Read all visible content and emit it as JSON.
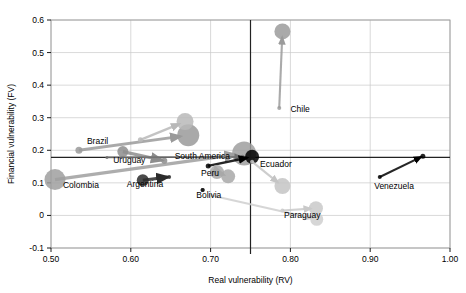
{
  "chart_data": {
    "type": "scatter",
    "title": "",
    "xlabel": "Real vulnerability (RV)",
    "ylabel": "Financial vulnerability (FV)",
    "xlim": [
      0.5,
      1.0
    ],
    "ylim": [
      -0.1,
      0.6
    ],
    "xticks": [
      "0.50",
      "0.60",
      "0.70",
      "0.80",
      "0.90",
      "1.00"
    ],
    "xtick_values": [
      0.5,
      0.6,
      0.7,
      0.8,
      0.9,
      1.0
    ],
    "yticks": [
      "-0.1",
      "0",
      "0.1",
      "0.2",
      "0.3",
      "0.4",
      "0.5",
      "0.6"
    ],
    "ytick_values": [
      -0.1,
      0,
      0.1,
      0.2,
      0.3,
      0.4,
      0.5,
      0.6
    ],
    "grid": true,
    "legend": "none",
    "reference_lines": [
      {
        "name": "vertical-reference-line",
        "orientation": "vertical",
        "value": 0.75
      },
      {
        "name": "horizontal-reference-line",
        "orientation": "horizontal",
        "value": 0.178
      }
    ],
    "annotations": [
      {
        "label": "Brazil",
        "x": 0.545,
        "y": 0.218
      },
      {
        "label": "Uruguay",
        "x": 0.578,
        "y": 0.162
      },
      {
        "label": "South America",
        "x": 0.655,
        "y": 0.172
      },
      {
        "label": "Colombia",
        "x": 0.515,
        "y": 0.083
      },
      {
        "label": "Argentina",
        "x": 0.595,
        "y": 0.088
      },
      {
        "label": "Peru",
        "x": 0.688,
        "y": 0.122
      },
      {
        "label": "Bolivia",
        "x": 0.682,
        "y": 0.055
      },
      {
        "label": "Ecuador",
        "x": 0.762,
        "y": 0.148
      },
      {
        "label": "Chile",
        "x": 0.8,
        "y": 0.318
      },
      {
        "label": "Paraguay",
        "x": 0.792,
        "y": -0.008
      },
      {
        "label": "Venezuela",
        "x": 0.905,
        "y": 0.082
      }
    ],
    "series": [
      {
        "name": "Brazil",
        "color": "#9a9a9a",
        "start": {
          "x": 0.535,
          "y": 0.2,
          "size": 7
        },
        "end": {
          "x": 0.672,
          "y": 0.246,
          "size": 22
        }
      },
      {
        "name": "Brazil-secondary",
        "color": "#b8b8b8",
        "start": {
          "x": 0.612,
          "y": 0.232,
          "size": 5
        },
        "end": {
          "x": 0.668,
          "y": 0.288,
          "size": 17
        }
      },
      {
        "name": "Colombia",
        "color": "#9f9f9f",
        "start": {
          "x": 0.505,
          "y": 0.11,
          "size": 21
        },
        "end": {
          "x": 0.742,
          "y": 0.19,
          "size": 24
        }
      },
      {
        "name": "Uruguay",
        "color": "#8d8d8d",
        "start": {
          "x": 0.59,
          "y": 0.196,
          "size": 11
        },
        "end": {
          "x": 0.642,
          "y": 0.168,
          "size": 6
        }
      },
      {
        "name": "South America",
        "color": "#707070",
        "start": {
          "x": 0.57,
          "y": 0.178,
          "size": 3
        },
        "end": {
          "x": 0.74,
          "y": 0.18,
          "size": 4
        }
      },
      {
        "name": "Argentina",
        "color": "#2b2b2b",
        "start": {
          "x": 0.615,
          "y": 0.108,
          "size": 12
        },
        "end": {
          "x": 0.648,
          "y": 0.118,
          "size": 4
        }
      },
      {
        "name": "Peru",
        "color": "#000000",
        "start": {
          "x": 0.697,
          "y": 0.152,
          "size": 5
        },
        "end": {
          "x": 0.752,
          "y": 0.18,
          "size": 14
        }
      },
      {
        "name": "Bolivia",
        "color": "#1a1a1a",
        "start": {
          "x": 0.69,
          "y": 0.078,
          "size": 4
        },
        "end": {
          "x": 0.69,
          "y": 0.078,
          "size": 4
        }
      },
      {
        "name": "Ecuador-cluster",
        "color": "#a8a8a8",
        "start": {
          "x": 0.708,
          "y": 0.133,
          "size": 14
        },
        "end": {
          "x": 0.722,
          "y": 0.12,
          "size": 14
        }
      },
      {
        "name": "Chile",
        "color": "#9b9b9b",
        "start": {
          "x": 0.786,
          "y": 0.33,
          "size": 4
        },
        "end": {
          "x": 0.79,
          "y": 0.565,
          "size": 16
        }
      },
      {
        "name": "Paraguay",
        "color": "#c9c9c9",
        "start": {
          "x": 0.79,
          "y": 0.015,
          "size": 4
        },
        "end": {
          "x": 0.832,
          "y": 0.022,
          "size": 14
        }
      },
      {
        "name": "Paraguay-secondary",
        "color": "#cfcfcf",
        "start": {
          "x": 0.7,
          "y": 0.062,
          "size": 4
        },
        "end": {
          "x": 0.833,
          "y": -0.012,
          "size": 13
        }
      },
      {
        "name": "Ecuador-down",
        "color": "#c4c4c4",
        "start": {
          "x": 0.752,
          "y": 0.165,
          "size": 4
        },
        "end": {
          "x": 0.79,
          "y": 0.09,
          "size": 16
        }
      },
      {
        "name": "Venezuela",
        "color": "#000000",
        "start": {
          "x": 0.912,
          "y": 0.118,
          "size": 4
        },
        "end": {
          "x": 0.966,
          "y": 0.182,
          "size": 5
        }
      }
    ]
  }
}
